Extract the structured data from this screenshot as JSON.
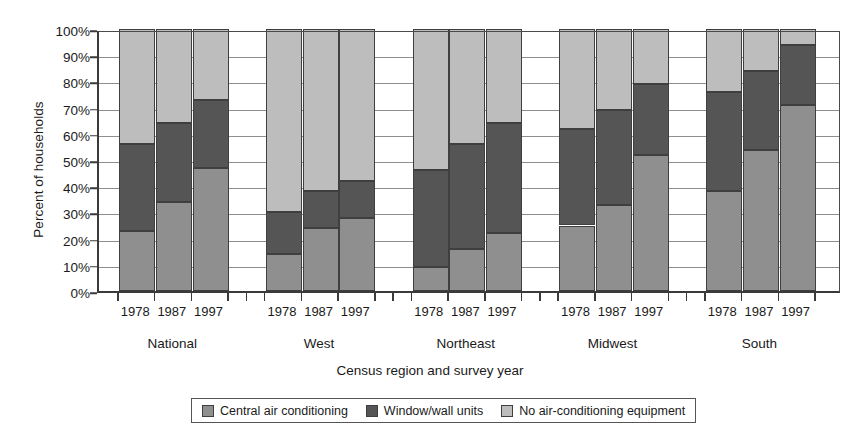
{
  "chart_data": {
    "type": "bar",
    "subtype": "stacked-bar-100-percent",
    "title": "",
    "xlabel": "Census region and survey year",
    "ylabel": "Percent of households",
    "ylim": [
      0,
      100
    ],
    "ytick_labels": [
      "0%",
      "10%",
      "20%",
      "30%",
      "40%",
      "50%",
      "60%",
      "70%",
      "80%",
      "90%",
      "100%"
    ],
    "ytick_values": [
      0,
      10,
      20,
      30,
      40,
      50,
      60,
      70,
      80,
      90,
      100
    ],
    "grid": true,
    "legend_position": "bottom",
    "groups": [
      "National",
      "West",
      "Northeast",
      "Midwest",
      "South"
    ],
    "categories": [
      "1978",
      "1987",
      "1997"
    ],
    "series": [
      {
        "name": "Central air conditioning",
        "color": "#8f8f8f",
        "values": {
          "National": [
            23,
            34,
            47
          ],
          "West": [
            14,
            24,
            28
          ],
          "Northeast": [
            9,
            16,
            22
          ],
          "Midwest": [
            25,
            33,
            52
          ],
          "South": [
            38,
            54,
            71
          ]
        }
      },
      {
        "name": "Window/wall units",
        "color": "#555555",
        "values": {
          "National": [
            33,
            30,
            26
          ],
          "West": [
            16,
            14,
            14
          ],
          "Northeast": [
            37,
            40,
            42
          ],
          "Midwest": [
            37,
            36,
            27
          ],
          "South": [
            38,
            30,
            23
          ]
        }
      },
      {
        "name": "No air-conditioning equipment",
        "color": "#bdbdbd",
        "values": {
          "National": [
            44,
            36,
            27
          ],
          "West": [
            70,
            62,
            58
          ],
          "Northeast": [
            54,
            44,
            36
          ],
          "Midwest": [
            38,
            31,
            21
          ],
          "South": [
            24,
            16,
            6
          ]
        }
      }
    ],
    "cumulative_tops": {
      "National": [
        [
          23,
          56
        ],
        [
          34,
          64
        ],
        [
          47,
          73
        ]
      ],
      "West": [
        [
          14,
          30
        ],
        [
          24,
          38
        ],
        [
          28,
          42
        ]
      ],
      "Northeast": [
        [
          9,
          46
        ],
        [
          16,
          56
        ],
        [
          22,
          64
        ]
      ],
      "Midwest": [
        [
          25,
          62
        ],
        [
          33,
          69
        ],
        [
          52,
          79
        ]
      ],
      "South": [
        [
          38,
          76
        ],
        [
          54,
          84
        ],
        [
          71,
          94
        ]
      ]
    }
  },
  "legend": {
    "items": [
      {
        "label": "Central air conditioning",
        "swatch": "sw-central"
      },
      {
        "label": "Window/wall units",
        "swatch": "sw-window"
      },
      {
        "label": "No air-conditioning equipment",
        "swatch": "sw-none"
      }
    ]
  }
}
